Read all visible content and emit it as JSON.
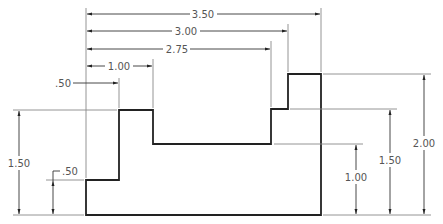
{
  "drawing": {
    "type": "dimensioned-profile",
    "units": "inches",
    "horizontal_dimensions": [
      {
        "label": "3.50",
        "from": 0,
        "to": 3.5
      },
      {
        "label": "3.00",
        "from": 0,
        "to": 3.0
      },
      {
        "label": "2.75",
        "from": 0,
        "to": 2.75
      },
      {
        "label": "1.00",
        "from": 0.5,
        "to": 1.5
      },
      {
        "label": ".50",
        "from": 0,
        "to": 0.5
      }
    ],
    "vertical_dimensions_left": [
      {
        "label": "1.50",
        "from": 0,
        "to": 1.5
      },
      {
        "label": ".50",
        "from": 0,
        "to": 0.5
      }
    ],
    "vertical_dimensions_right": [
      {
        "label": "1.00",
        "from": 0,
        "to": 1.0
      },
      {
        "label": "1.50",
        "from": 0,
        "to": 1.5
      },
      {
        "label": "2.00",
        "from": 0,
        "to": 2.0
      }
    ]
  },
  "labels": {
    "h350": "3.50",
    "h300": "3.00",
    "h275": "2.75",
    "h100": "1.00",
    "h050": ".50",
    "vl150": "1.50",
    "vl050": ".50",
    "vr100": "1.00",
    "vr150": "1.50",
    "vr200": "2.00"
  }
}
